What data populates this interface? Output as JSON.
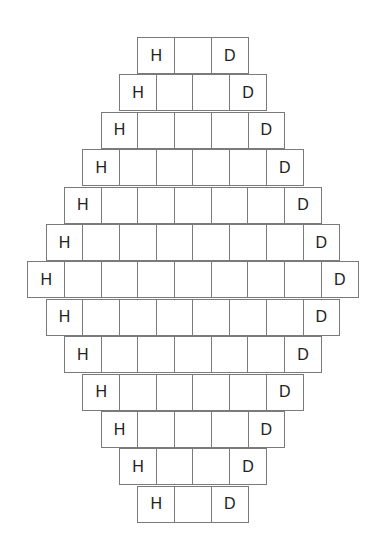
{
  "diagram": {
    "type": "hexagonal-brick-grid",
    "left_label": "H",
    "right_label": "D",
    "rows": [
      {
        "cells": 3
      },
      {
        "cells": 4
      },
      {
        "cells": 5
      },
      {
        "cells": 6
      },
      {
        "cells": 7
      },
      {
        "cells": 8
      },
      {
        "cells": 9
      },
      {
        "cells": 8
      },
      {
        "cells": 7
      },
      {
        "cells": 6
      },
      {
        "cells": 5
      },
      {
        "cells": 4
      },
      {
        "cells": 3
      }
    ]
  }
}
